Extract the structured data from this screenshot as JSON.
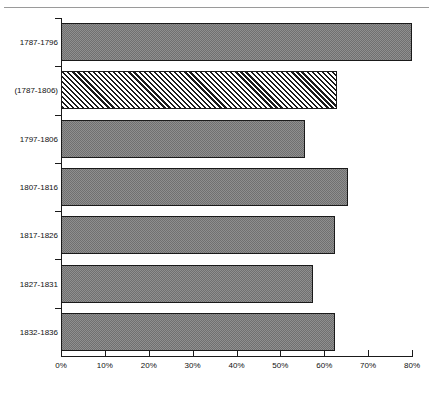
{
  "chart_data": {
    "type": "bar",
    "orientation": "horizontal",
    "title": "",
    "subtitle": "",
    "xlabel": "",
    "ylabel": "",
    "categories": [
      "1787-1796",
      "(1787-1806)",
      "1797-1806",
      "1807-1816",
      "1817-1826",
      "1827-1831",
      "1832-1836"
    ],
    "values": [
      80,
      63,
      55.5,
      65.5,
      62.5,
      57.5,
      62.5
    ],
    "value_unit": "%",
    "series": [
      {
        "name": "Percentage",
        "values": [
          80,
          63,
          55.5,
          65.5,
          62.5,
          57.5,
          62.5
        ]
      }
    ],
    "bar_styles": [
      "solid",
      "hatched",
      "solid",
      "solid",
      "solid",
      "solid",
      "solid"
    ],
    "xlim": [
      0,
      80
    ],
    "x_tick_values": [
      0,
      10,
      20,
      30,
      40,
      50,
      60,
      70,
      80
    ],
    "x_tick_labels": [
      "0%",
      "10%",
      "20%",
      "30%",
      "40%",
      "50%",
      "60%",
      "70%",
      "80%"
    ],
    "grid": false,
    "legend": null,
    "legend_position": "none",
    "annotations": [],
    "colors": {
      "bar_fill": "#8f8f8f",
      "bar_border": "#1a1a1a",
      "hatch_stroke": "#1a1a1a",
      "axis": "#1a1a1a",
      "text": "#111111",
      "background": "#ffffff",
      "top_rule": "#9a9a9a"
    }
  }
}
